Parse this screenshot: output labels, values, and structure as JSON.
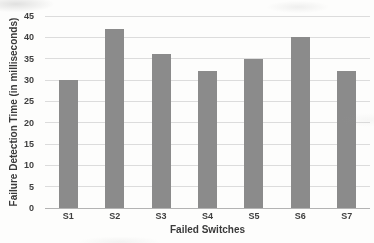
{
  "chart_data": {
    "type": "bar",
    "categories": [
      "S1",
      "S2",
      "S3",
      "S4",
      "S5",
      "S6",
      "S7"
    ],
    "values": [
      30,
      42,
      36,
      32,
      35,
      40,
      32
    ],
    "title": "",
    "xlabel": "Failed Switches",
    "ylabel": "Failure Detection Time (in milliseconds)",
    "ylim": [
      0,
      45
    ],
    "yticks": [
      0,
      5,
      10,
      15,
      20,
      25,
      30,
      35,
      40,
      45
    ],
    "grid": true,
    "legend": "none",
    "colors": {
      "bar": "#8b8b8b",
      "gridline": "#dcdcdc",
      "axis_line": "#b3b3b3",
      "text": "#3f3f3f",
      "background": "#fdfdfc"
    }
  }
}
